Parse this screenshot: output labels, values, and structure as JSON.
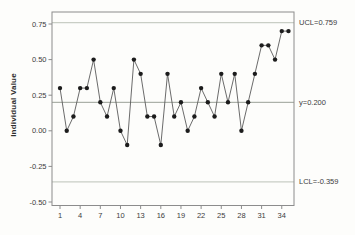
{
  "figure": {
    "title": "",
    "y_axis_title": "Individual Value",
    "annotations": {
      "ucl_label": "UCL=0.759",
      "center_label": "y=0.200",
      "lcl_label": "LCL=-0.359"
    }
  },
  "chart_data": {
    "type": "line",
    "subtype": "individuals-control-chart",
    "title": "",
    "xlabel": "",
    "ylabel": "Individual Value",
    "x": [
      1,
      2,
      3,
      4,
      5,
      6,
      7,
      8,
      9,
      10,
      11,
      12,
      13,
      14,
      15,
      16,
      17,
      18,
      19,
      20,
      21,
      22,
      23,
      24,
      25,
      26,
      27,
      28,
      29,
      30,
      31,
      32,
      33,
      34,
      35
    ],
    "values": [
      0.3,
      0.0,
      0.1,
      0.3,
      0.3,
      0.5,
      0.2,
      0.1,
      0.3,
      0.0,
      -0.1,
      0.5,
      0.4,
      0.1,
      0.1,
      -0.1,
      0.4,
      0.1,
      0.2,
      0.0,
      0.1,
      0.3,
      0.2,
      0.1,
      0.4,
      0.2,
      0.4,
      0.0,
      0.2,
      0.4,
      0.6,
      0.6,
      0.5,
      0.7,
      0.7
    ],
    "xticks": [
      1,
      4,
      7,
      10,
      13,
      16,
      19,
      22,
      25,
      28,
      31,
      34
    ],
    "ytick_labels": [
      "0.75",
      "0.50",
      "0.25",
      "0.00",
      "-0.25",
      "-0.50"
    ],
    "yticks": [
      0.75,
      0.5,
      0.25,
      0.0,
      -0.25,
      -0.5
    ],
    "xlim": [
      0,
      36
    ],
    "ylim": [
      -0.525,
      0.834
    ],
    "grid": false,
    "legend": false,
    "control_lines": [
      {
        "role": "ucl",
        "value": 0.759,
        "label": "UCL=0.759"
      },
      {
        "role": "center",
        "value": 0.2,
        "label": "y=0.200"
      },
      {
        "role": "lcl",
        "value": -0.359,
        "label": "LCL=-0.359"
      }
    ],
    "colors": {
      "marker": "#1c1c1c",
      "series_line": "#5a5a5a",
      "limit_line": "#bcc2b8",
      "center_line": "#9aa096",
      "frame": "#8c8c8c",
      "text": "#3c3c3c",
      "background": "#fdfdfb"
    }
  }
}
